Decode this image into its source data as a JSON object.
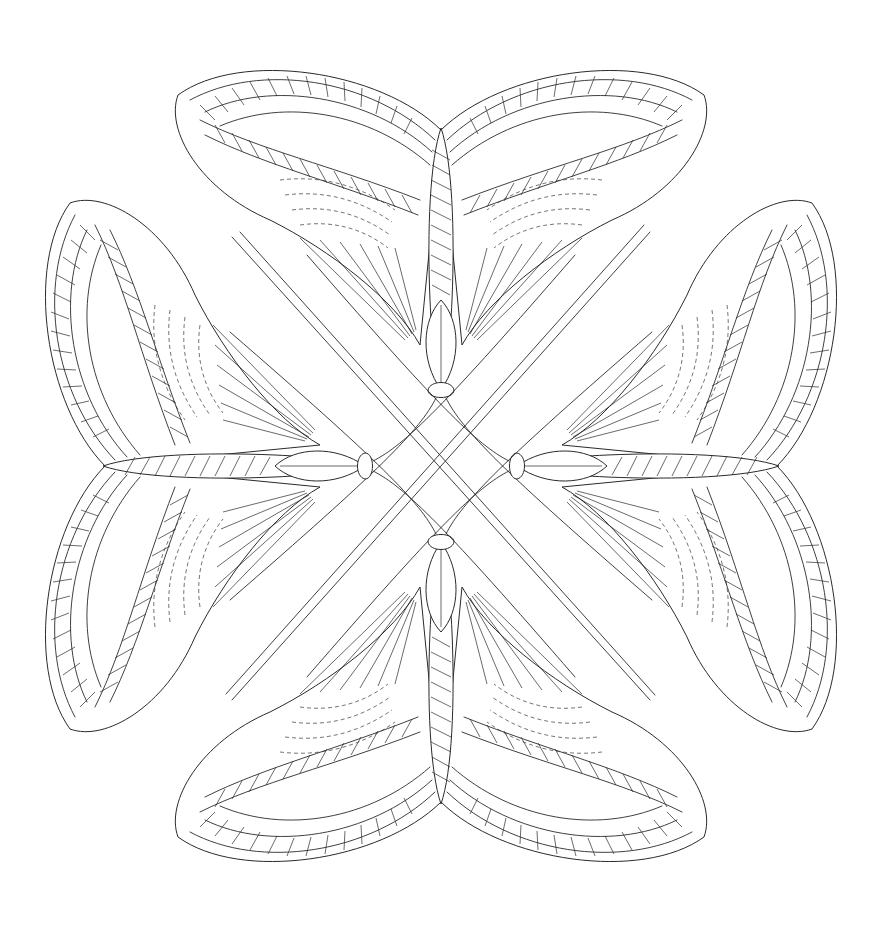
{
  "artwork": {
    "subject": "Four moths arranged in rotational symmetry, coloring page line art",
    "background": "#ffffff",
    "line_color": "#2a2a2a",
    "center": [
      441,
      466
    ],
    "moths": [
      {
        "name": "moth-top",
        "rotation": 0,
        "body_top": [
          441,
          130
        ],
        "body_bottom": [
          441,
          395
        ]
      },
      {
        "name": "moth-right",
        "rotation": 90,
        "body_top": [
          830,
          466
        ],
        "body_bottom": [
          505,
          466
        ]
      },
      {
        "name": "moth-bottom",
        "rotation": 180,
        "body_top": [
          441,
          830
        ],
        "body_bottom": [
          441,
          540
        ]
      },
      {
        "name": "moth-left",
        "rotation": 270,
        "body_top": [
          60,
          466
        ],
        "body_bottom": [
          375,
          466
        ]
      }
    ],
    "antennae_crossing": true
  }
}
